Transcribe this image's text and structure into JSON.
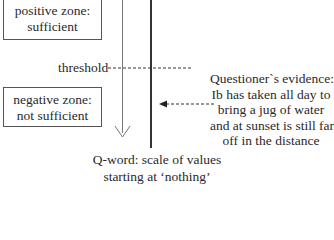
{
  "zones": {
    "positive": {
      "line1": "positive zone:",
      "line2": "sufficient"
    },
    "negative": {
      "line1": "negative zone:",
      "line2": "not sufficient"
    }
  },
  "threshold": {
    "label": "threshold"
  },
  "evidence": {
    "lines": [
      "Questioner`s evidence:",
      "Ib has taken all day to",
      "bring a jug of water",
      "and at sunset is still far",
      "off in the distance"
    ]
  },
  "caption": {
    "lines": [
      "Q-word: scale of values",
      "starting at ‘nothing’"
    ]
  },
  "colors": {
    "line": "#333333",
    "scale_arrow": "#777777",
    "text": "#2a2a2a"
  }
}
